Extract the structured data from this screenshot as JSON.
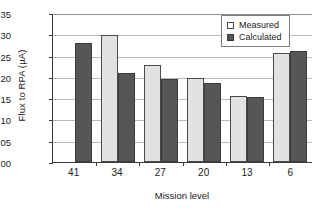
{
  "chart_data": {
    "type": "bar",
    "title": "",
    "xlabel": "Mission level",
    "ylabel": "Flux to RPA (µA)",
    "categories": [
      "41",
      "34",
      "27",
      "20",
      "13",
      "6"
    ],
    "series": [
      {
        "name": "Measured",
        "color": "#e2e2e2",
        "values": [
          null,
          0.299,
          0.227,
          0.197,
          0.155,
          0.256
        ]
      },
      {
        "name": "Calculated",
        "color": "#565656",
        "values": [
          0.28,
          0.208,
          0.195,
          0.186,
          0.152,
          0.261
        ]
      }
    ],
    "ylim": [
      0.0,
      0.35
    ],
    "ytick_labels": [
      "0.00",
      "0.05",
      "0.10",
      "0.15",
      "0.20",
      "0.25",
      "0.30",
      "0.35"
    ],
    "ytick_values": [
      0.0,
      0.05,
      0.1,
      0.15,
      0.2,
      0.25,
      0.3,
      0.35
    ],
    "grid": "horizontal",
    "legend_position": "top-right"
  }
}
